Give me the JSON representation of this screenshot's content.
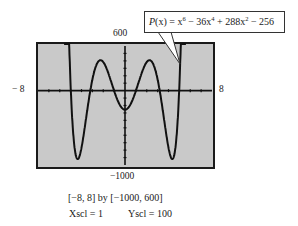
{
  "chart_data": {
    "type": "line",
    "title": "",
    "function_label": "P(x) = x^6 - 36x^4 + 288x^2 - 256",
    "xlim": [
      -8,
      8
    ],
    "ylim": [
      -1000,
      600
    ],
    "xscl": 1,
    "yscl": 100,
    "grid": false,
    "axis_labels": {
      "xmin": "− 8",
      "xmax": "8",
      "ymax": "600",
      "ymin": "−1000"
    },
    "series": [
      {
        "name": "P(x)",
        "x": [
          -5.2,
          -5,
          -4.5,
          -4.4,
          -4,
          -3,
          -2,
          -1,
          0,
          1,
          2,
          3,
          4,
          4.4,
          4.5,
          5,
          5.2
        ],
        "values": [
          985,
          69,
          -882,
          -884,
          -768,
          149,
          384,
          -3,
          -256,
          -3,
          384,
          149,
          -768,
          -884,
          -882,
          69,
          985
        ]
      }
    ],
    "window_caption": "[−8, 8]  by  [−1000, 600]",
    "scale_caption": {
      "xscl": "Xscl = 1",
      "yscl": "Yscl = 100"
    }
  },
  "callout": {
    "P": "P",
    "x_paren": "(x)",
    "eq": " = x",
    "exp6": "6",
    "t2": " − 36x",
    "exp4": "4",
    "t3": " + 288x",
    "exp2": "2",
    "t4": " − 256"
  },
  "colors": {
    "screen": "#c8c8c8",
    "frame": "#1a1a1a",
    "curve": "#111111",
    "axes": "#111111"
  }
}
